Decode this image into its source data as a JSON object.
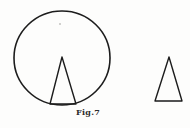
{
  "figure": {
    "caption": "Fig.7",
    "background_color": "#fdfdfc",
    "ink_color": "#1d1d1d",
    "shapes": {
      "circle": {
        "name": "sphere-outline-circle",
        "center_x": 62,
        "center_y": 58,
        "radius": 47,
        "stroke_width": 1.6
      },
      "inscribed_triangle": {
        "name": "inscribed-cone-triangle",
        "apex_x": 62,
        "apex_y": 57,
        "base_left_x": 50,
        "base_left_y": 104,
        "base_right_x": 76,
        "base_right_y": 104,
        "stroke_width": 1.4
      },
      "standalone_triangle": {
        "name": "detached-cone-triangle",
        "apex_x": 169,
        "apex_y": 57,
        "base_left_x": 155,
        "base_left_y": 101,
        "base_right_x": 182,
        "base_right_y": 101,
        "stroke_width": 1.4
      }
    },
    "speck_mark": {
      "name": "paper-speck",
      "x": 60,
      "y": 24,
      "radius": 0.8
    }
  }
}
